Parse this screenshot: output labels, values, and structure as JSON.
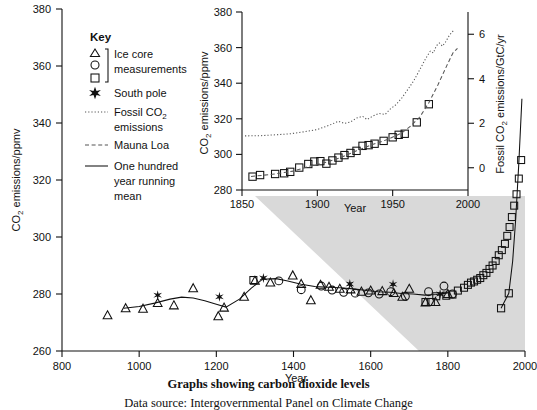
{
  "caption": {
    "title": "Graphs showing carbon dioxide levels",
    "source": "Data source: Intergovernmental Panel on Climate Change"
  },
  "legend": {
    "title": "Key",
    "items": [
      {
        "symbol": "triangle-circle-square-bracket",
        "label_line1": "Ice core",
        "label_line2": "measurements"
      },
      {
        "symbol": "filled-star",
        "label_line1": "South pole",
        "label_line2": ""
      },
      {
        "symbol": "dotted-line",
        "label_line1": "Fossil CO₂",
        "label_line2": "emissions"
      },
      {
        "symbol": "dashed-line",
        "label_line1": "Mauna Loa",
        "label_line2": ""
      },
      {
        "symbol": "solid-line",
        "label_line1": "One hundred",
        "label_line2": "year running",
        "label_line3": "mean"
      }
    ]
  },
  "chart_data": [
    {
      "id": "main",
      "type": "scatter",
      "title": "",
      "xlabel": "Year",
      "ylabel": "CO2 emissions/ppmv",
      "ylabel_display": "CO₂ emissions/ppmv",
      "xlim": [
        800,
        2000
      ],
      "ylim": [
        260,
        380
      ],
      "xticks": [
        800,
        1000,
        1200,
        1400,
        1600,
        1800,
        2000
      ],
      "yticks": [
        260,
        280,
        300,
        320,
        340,
        360,
        380
      ],
      "grid": false,
      "legend_position": "upper-left",
      "series": [
        {
          "name": "Ice core measurements (triangles)",
          "marker": "triangle",
          "points": [
            [
              918,
              272.5
            ],
            [
              965,
              275.0
            ],
            [
              1010,
              274.8
            ],
            [
              1048,
              276.8
            ],
            [
              1090,
              276.0
            ],
            [
              1140,
              282.0
            ],
            [
              1205,
              272.2
            ],
            [
              1220,
              275.2
            ],
            [
              1272,
              279.0
            ],
            [
              1300,
              284.6
            ],
            [
              1340,
              284.0
            ],
            [
              1398,
              286.5
            ],
            [
              1420,
              283.5
            ],
            [
              1445,
              277.8
            ],
            [
              1470,
              283.2
            ],
            [
              1492,
              282.5
            ],
            [
              1520,
              281.8
            ],
            [
              1548,
              281.6
            ],
            [
              1576,
              280.8
            ],
            [
              1600,
              281.2
            ],
            [
              1630,
              281.0
            ],
            [
              1660,
              280.3
            ],
            [
              1682,
              279.0
            ],
            [
              1700,
              281.8
            ],
            [
              1742,
              277.0
            ],
            [
              1768,
              277.2
            ],
            [
              1800,
              280.0
            ]
          ]
        },
        {
          "name": "Ice core measurements (circles)",
          "marker": "circle",
          "points": [
            [
              1362,
              284.6
            ],
            [
              1420,
              281.5
            ],
            [
              1472,
              282.8
            ],
            [
              1500,
              281.4
            ],
            [
              1530,
              280.6
            ],
            [
              1560,
              280.3
            ],
            [
              1594,
              280.4
            ],
            [
              1622,
              280.0
            ],
            [
              1652,
              280.8
            ],
            [
              1690,
              279.2
            ],
            [
              1750,
              280.8
            ],
            [
              1790,
              282.8
            ],
            [
              1812,
              280.0
            ]
          ]
        },
        {
          "name": "Ice core measurements (squares)",
          "marker": "square",
          "points": [
            [
              1296,
              284.9
            ],
            [
              1742,
              277.2
            ],
            [
              1756,
              277.2
            ],
            [
              1770,
              279.2
            ],
            [
              1796,
              279.4
            ],
            [
              1812,
              279.8
            ],
            [
              1826,
              281.2
            ],
            [
              1842,
              282.2
            ],
            [
              1852,
              283.2
            ],
            [
              1860,
              284.0
            ],
            [
              1868,
              284.4
            ],
            [
              1876,
              285.0
            ],
            [
              1884,
              285.6
            ],
            [
              1892,
              286.6
            ],
            [
              1900,
              287.4
            ],
            [
              1908,
              288.8
            ],
            [
              1916,
              290.0
            ],
            [
              1924,
              291.6
            ],
            [
              1932,
              293.6
            ],
            [
              1940,
              295.4
            ],
            [
              1948,
              297.6
            ],
            [
              1954,
              300.4
            ],
            [
              1960,
              303.5
            ],
            [
              1966,
              307.0
            ],
            [
              1972,
              311.0
            ],
            [
              1978,
              315.0
            ],
            [
              1984,
              320.5
            ],
            [
              1990,
              327.0
            ]
          ]
        },
        {
          "name": "South pole",
          "marker": "star",
          "points": [
            [
              1048,
              279.6
            ],
            [
              1208,
              279.0
            ],
            [
              1322,
              285.6
            ],
            [
              1546,
              283.5
            ],
            [
              1658,
              283.4
            ],
            [
              1780,
              280.0
            ]
          ]
        },
        {
          "name": "One hundred year running mean",
          "marker": "line",
          "points": [
            [
              960,
              275.0
            ],
            [
              1000,
              275.6
            ],
            [
              1040,
              276.8
            ],
            [
              1080,
              278.2
            ],
            [
              1110,
              278.9
            ],
            [
              1140,
              278.6
            ],
            [
              1170,
              277.6
            ],
            [
              1200,
              276.4
            ],
            [
              1225,
              275.4
            ],
            [
              1260,
              278.2
            ],
            [
              1290,
              282.0
            ],
            [
              1320,
              285.2
            ],
            [
              1355,
              285.4
            ],
            [
              1385,
              284.6
            ],
            [
              1420,
              283.4
            ],
            [
              1455,
              282.6
            ],
            [
              1490,
              282.4
            ],
            [
              1520,
              282.2
            ],
            [
              1555,
              281.8
            ],
            [
              1590,
              281.2
            ],
            [
              1620,
              280.8
            ],
            [
              1650,
              280.6
            ],
            [
              1680,
              280.2
            ],
            [
              1710,
              280.0
            ],
            [
              1740,
              279.6
            ],
            [
              1770,
              279.8
            ],
            [
              1800,
              280.4
            ]
          ]
        },
        {
          "name": "Fossil CO2 emissions (right axis, GtC/yr)",
          "marker": "solid-line-right-axis",
          "points": [
            [
              1938,
              0.0
            ],
            [
              1958,
              0.35
            ],
            [
              1968,
              1.1
            ],
            [
              1976,
              2.1
            ],
            [
              1984,
              3.4
            ],
            [
              1992,
              4.9
            ]
          ]
        }
      ]
    },
    {
      "id": "inset",
      "type": "scatter",
      "title": "",
      "xlabel": "Year",
      "ylabel": "CO2 emissions/ppmv",
      "ylabel_display": "CO₂ emissions/ppmv",
      "y2label_display": "Fossil CO₂ emissions/GtC/yr",
      "xlim": [
        1850,
        2000
      ],
      "ylim": [
        280,
        380
      ],
      "y2lim": [
        -1.0,
        7.0
      ],
      "xticks": [
        1850,
        1900,
        1950,
        2000
      ],
      "yticks": [
        280,
        300,
        320,
        340,
        360,
        380
      ],
      "y2ticks": [
        0,
        2,
        4,
        6
      ],
      "grid": false,
      "series": [
        {
          "name": "Ice core measurements (squares)",
          "marker": "square",
          "points": [
            [
              1857,
              287.5
            ],
            [
              1862,
              288.4
            ],
            [
              1872,
              289.0
            ],
            [
              1878,
              289.4
            ],
            [
              1882,
              290.2
            ],
            [
              1888,
              292.6
            ],
            [
              1894,
              294.6
            ],
            [
              1898,
              296.0
            ],
            [
              1902,
              296.2
            ],
            [
              1906,
              294.8
            ],
            [
              1910,
              296.6
            ],
            [
              1914,
              298.2
            ],
            [
              1918,
              299.6
            ],
            [
              1922,
              300.8
            ],
            [
              1926,
              302.0
            ],
            [
              1930,
              304.8
            ],
            [
              1934,
              305.2
            ],
            [
              1938,
              306.0
            ],
            [
              1944,
              307.6
            ],
            [
              1950,
              309.6
            ],
            [
              1954,
              311.0
            ],
            [
              1958,
              311.6
            ],
            [
              1966,
              318.0
            ],
            [
              1974,
              328.2
            ]
          ]
        },
        {
          "name": "Mauna Loa",
          "marker": "dashed-line",
          "points": [
            [
              1856,
              287.6
            ],
            [
              1870,
              288.8
            ],
            [
              1884,
              290.6
            ],
            [
              1896,
              293.6
            ],
            [
              1906,
              295.6
            ],
            [
              1916,
              298.4
            ],
            [
              1926,
              302.0
            ],
            [
              1936,
              305.4
            ],
            [
              1946,
              308.2
            ],
            [
              1956,
              312.0
            ],
            [
              1962,
              316.0
            ],
            [
              1968,
              321.0
            ],
            [
              1974,
              329.0
            ],
            [
              1980,
              339.0
            ],
            [
              1986,
              350.0
            ],
            [
              1990,
              357.0
            ],
            [
              1993,
              359.6
            ]
          ]
        },
        {
          "name": "Fossil CO2 emissions (right axis, GtC/yr)",
          "marker": "dotted-line",
          "points": [
            [
              1852,
              310.4
            ],
            [
              1862,
              310.5
            ],
            [
              1872,
              311.0
            ],
            [
              1882,
              311.6
            ],
            [
              1892,
              312.8
            ],
            [
              1900,
              314.0
            ],
            [
              1908,
              316.4
            ],
            [
              1914,
              318.6
            ],
            [
              1918,
              317.4
            ],
            [
              1922,
              318.2
            ],
            [
              1926,
              320.4
            ],
            [
              1930,
              321.4
            ],
            [
              1933,
              319.6
            ],
            [
              1937,
              321.6
            ],
            [
              1941,
              323.0
            ],
            [
              1945,
              322.4
            ],
            [
              1948,
              325.2
            ],
            [
              1952,
              327.8
            ],
            [
              1956,
              331.6
            ],
            [
              1960,
              336.4
            ],
            [
              1964,
              341.4
            ],
            [
              1968,
              347.6
            ],
            [
              1972,
              354.0
            ],
            [
              1975,
              358.0
            ],
            [
              1977,
              357.0
            ],
            [
              1979,
              361.0
            ],
            [
              1981,
              362.6
            ],
            [
              1983,
              360.8
            ],
            [
              1985,
              363.0
            ],
            [
              1987,
              366.0
            ],
            [
              1989,
              368.4
            ],
            [
              1991,
              370.0
            ]
          ]
        }
      ]
    }
  ]
}
